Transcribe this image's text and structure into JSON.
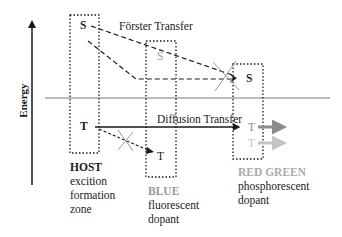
{
  "axis": {
    "label": "Energy"
  },
  "transfers": {
    "forster": "Förster Transfer",
    "diffusion": "Diffusion Transfer"
  },
  "levels": {
    "host_singlet": "S",
    "host_triplet": "T",
    "blue_singlet": "S",
    "blue_triplet": "T",
    "rg_singlet": "S",
    "red_triplet": "T",
    "green_triplet": "T"
  },
  "zones": {
    "host": {
      "title": "HOST",
      "line1": "excition",
      "line2": "formation",
      "line3": "zone"
    },
    "blue": {
      "title": "BLUE",
      "line1": "fluorescent",
      "line2": "dopant"
    },
    "redgreen": {
      "title": "RED GREEN",
      "line1": "phosphorescent",
      "line2": "dopant"
    }
  },
  "colors": {
    "ink": "#1a1a1a",
    "gray_line": "#bdbdbd",
    "gray_text": "#9a9a9a",
    "red_arrow": "#8c8c8c",
    "green_arrow": "#c4c4c4"
  }
}
